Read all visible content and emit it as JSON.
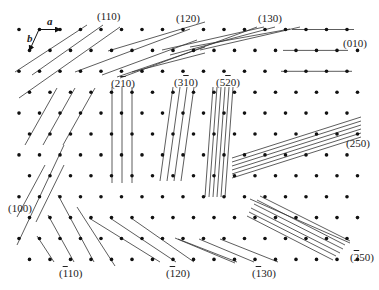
{
  "diagram": {
    "lattice": {
      "rows": 12,
      "row_y_start": 29.5,
      "row_dy": 20.9,
      "even_x_start": 19,
      "odd_x_start": 29.5,
      "dx": 20.5,
      "even_count": 17,
      "odd_count": 17,
      "dot_radius": 1.8,
      "dot_color": "#111111",
      "line_color": "#333333"
    },
    "basis_vectors": {
      "a": {
        "label": "a",
        "from": [
          39,
          29.5
        ],
        "to": [
          60,
          29.5
        ]
      },
      "b": {
        "label": "b",
        "from": [
          39,
          29.5
        ],
        "to": [
          29.5,
          50.4
        ]
      }
    },
    "plane_families": [
      {
        "label": "(110)",
        "label_pos": [
          97,
          13
        ],
        "segments": [
          [
            [
              15,
              72
            ],
            [
              87,
              25
            ]
          ],
          [
            [
              32,
              75
            ],
            [
              103,
              25
            ]
          ],
          [
            [
              19,
              98
            ],
            [
              120,
              27
            ]
          ]
        ]
      },
      {
        "label": "(120)",
        "label_pos": [
          176,
          13
        ],
        "segments": [
          [
            [
              75,
              72
            ],
            [
              190,
              29
            ]
          ],
          [
            [
              102,
              75
            ],
            [
              197,
              40
            ]
          ],
          [
            [
              108,
              51
            ],
            [
              205,
              22
            ]
          ],
          [
            [
              117,
              77
            ],
            [
              205,
              47
            ]
          ],
          [
            [
              132,
              72
            ],
            [
              205,
              53
            ]
          ]
        ]
      },
      {
        "label": "(130)",
        "label_pos": [
          258,
          13
        ],
        "segments": [
          [
            [
              120,
              78
            ],
            [
              257,
              27
            ]
          ],
          [
            [
              162,
              50
            ],
            [
              264,
              27
            ]
          ],
          [
            [
              170,
              55
            ],
            [
              275,
              27
            ]
          ],
          [
            [
              190,
              47
            ],
            [
              290,
              29
            ]
          ],
          [
            [
              200,
              50
            ],
            [
              300,
              27
            ]
          ]
        ]
      },
      {
        "label": "(010)",
        "label_pos": [
          345,
          42
        ],
        "segments": [
          [
            [
              292,
              29.5
            ],
            [
              354,
              29.5
            ]
          ],
          [
            [
              283,
              50.4
            ],
            [
              348,
              50.4
            ]
          ],
          [
            [
              281,
              71.3
            ],
            [
              352,
              71.3
            ]
          ]
        ]
      },
      {
        "label": "(100)",
        "label_pos": [
          8,
          203
        ],
        "segments": [
          [
            [
              25,
              145
            ],
            [
              57,
              88
            ]
          ],
          [
            [
              43,
              145
            ],
            [
              75,
              88
            ]
          ],
          [
            [
              63,
              145
            ],
            [
              95,
              88
            ]
          ],
          [
            [
              17,
              217
            ],
            [
              45,
              165
            ]
          ],
          [
            [
              17,
              245
            ],
            [
              64,
              145
            ]
          ],
          [
            [
              36,
              222
            ],
            [
              64,
              165
            ]
          ]
        ]
      },
      {
        "label": "(2̅0)",
        "label_text": {
          "pre": "(2",
          "bar": "1",
          "post": "0)"
        },
        "label_pos": [
          112,
          83
        ],
        "segments": [
          [
            [
              112,
              87
            ],
            [
              112,
              183
            ]
          ],
          [
            [
              122,
              87
            ],
            [
              122,
              183
            ]
          ],
          [
            [
              132,
              87
            ],
            [
              132,
              183
            ]
          ]
        ]
      },
      {
        "label": "(3̅0)",
        "label_text": {
          "pre": "(3",
          "bar": "1",
          "post": "0)"
        },
        "label_pos": [
          175,
          83
        ],
        "segments": [
          [
            [
              160,
              181
            ],
            [
              173,
              87
            ]
          ],
          [
            [
              167,
              181
            ],
            [
              180,
              87
            ]
          ],
          [
            [
              174,
              181
            ],
            [
              187,
              87
            ]
          ],
          [
            [
              181,
              181
            ],
            [
              194,
              87
            ]
          ]
        ]
      },
      {
        "label": "(5̂0)",
        "label_text": {
          "pre": "(5",
          "bar": "2",
          "post": "0)"
        },
        "label_pos": [
          217,
          83
        ],
        "segments": [
          [
            [
              205,
              197
            ],
            [
              213,
              87
            ]
          ],
          [
            [
              209,
              197
            ],
            [
              217,
              87
            ]
          ],
          [
            [
              213,
              197
            ],
            [
              221,
              87
            ]
          ],
          [
            [
              217,
              197
            ],
            [
              225,
              87
            ]
          ],
          [
            [
              221,
              197
            ],
            [
              229,
              87
            ]
          ],
          [
            [
              225,
              197
            ],
            [
              233,
              87
            ]
          ]
        ]
      },
      {
        "label": "(250)",
        "label_pos": [
          345,
          140
        ],
        "segments": [
          [
            [
              232,
              158
            ],
            [
              361,
              117
            ]
          ],
          [
            [
              232,
              162
            ],
            [
              361,
              121
            ]
          ],
          [
            [
              232,
              166
            ],
            [
              361,
              125
            ]
          ],
          [
            [
              232,
              170
            ],
            [
              361,
              129
            ]
          ],
          [
            [
              232,
              174
            ],
            [
              361,
              133
            ]
          ],
          [
            [
              232,
              178
            ],
            [
              361,
              137
            ]
          ]
        ]
      },
      {
        "label": "(̅0)",
        "label_text": {
          "pre": "(",
          "bar": "2",
          "post": "50)"
        },
        "label_pos": [
          346,
          254
        ],
        "segments": [
          [
            [
              260,
              196
            ],
            [
              350,
              241
            ]
          ],
          [
            [
              257,
              200
            ],
            [
              345,
              245
            ]
          ],
          [
            [
              254,
              204
            ],
            [
              343,
              249
            ]
          ],
          [
            [
              251,
              208
            ],
            [
              340,
              253
            ]
          ],
          [
            [
              249,
              212
            ],
            [
              336,
              256
            ]
          ],
          [
            [
              247,
              216
            ],
            [
              333,
              260
            ]
          ],
          [
            [
              250,
              199
            ],
            [
              350,
              243
            ]
          ]
        ]
      },
      {
        "label": "(̅10)",
        "label_text": {
          "pre": "(",
          "bar": "1",
          "post": "10)"
        },
        "label_pos": [
          58,
          265
        ],
        "segments": [
          [
            [
              37,
              236
            ],
            [
              54,
              262
            ]
          ],
          [
            [
              48,
              215
            ],
            [
              74,
              262
            ]
          ],
          [
            [
              58,
              195
            ],
            [
              94,
              262
            ]
          ],
          [
            [
              77,
              207
            ],
            [
              115,
              266
            ]
          ]
        ]
      },
      {
        "label": "(̅20)",
        "label_text": {
          "pre": "(",
          "bar": "1",
          "post": "20)"
        },
        "label_pos": [
          165,
          265
        ],
        "segments": [
          [
            [
              89,
              218
            ],
            [
              160,
              262
            ]
          ],
          [
            [
              110,
              218
            ],
            [
              176,
              262
            ]
          ],
          [
            [
              131,
              218
            ],
            [
              194,
              262
            ]
          ]
        ]
      },
      {
        "label": "(̅30)",
        "label_text": {
          "pre": "(",
          "bar": "1",
          "post": "30)"
        },
        "label_pos": [
          251,
          265
        ],
        "segments": [
          [
            [
              178,
              239
            ],
            [
              237,
              262
            ]
          ],
          [
            [
              199,
              239
            ],
            [
              254,
              262
            ]
          ],
          [
            [
              220,
              239
            ],
            [
              278,
              262
            ]
          ],
          [
            [
              175,
              238
            ],
            [
              235,
              263
            ]
          ]
        ]
      }
    ],
    "labels": {
      "l110": "(110)",
      "l120": "(120)",
      "l130": "(130)",
      "l010": "(010)",
      "l100": "(100)",
      "l250": "(250)",
      "a": "a",
      "b": "b",
      "l2b10_pre": "(2",
      "l2b10_bar": "1",
      "l2b10_post": "0)",
      "l3b10_pre": "(3",
      "l3b10_bar": "1",
      "l3b10_post": "0)",
      "l5b20_pre": "(5",
      "l5b20_bar": "2",
      "l5b20_post": "0)",
      "lb250_pre": "(",
      "lb250_bar": "2",
      "lb250_post": "50)",
      "lb110_pre": "(",
      "lb110_bar": "1",
      "lb110_post": "10)",
      "lb120_pre": "(",
      "lb120_bar": "1",
      "lb120_post": "20)",
      "lb130_pre": "(",
      "lb130_bar": "1",
      "lb130_post": "30)"
    }
  }
}
